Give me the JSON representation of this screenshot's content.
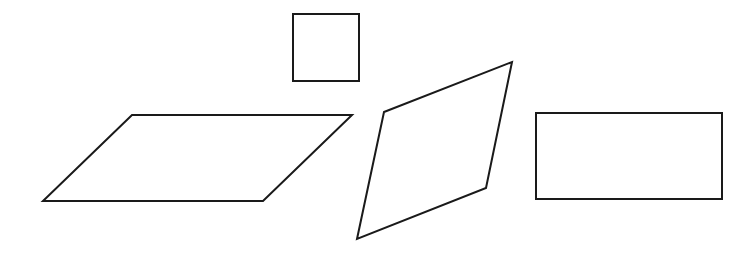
{
  "diagram": {
    "background": "#ffffff",
    "stroke_color": "#1a1a1a",
    "shapes": [
      {
        "name": "square",
        "type": "polygon",
        "stroke_width": 2,
        "points": [
          [
            293,
            14
          ],
          [
            359,
            14
          ],
          [
            359,
            81
          ],
          [
            293,
            81
          ]
        ]
      },
      {
        "name": "parallelogram",
        "type": "polygon",
        "stroke_width": 2,
        "points": [
          [
            132,
            115
          ],
          [
            352,
            115
          ],
          [
            263,
            201
          ],
          [
            43,
            201
          ]
        ]
      },
      {
        "name": "rhombus",
        "type": "polygon",
        "stroke_width": 2,
        "points": [
          [
            384,
            112
          ],
          [
            512,
            62
          ],
          [
            486,
            188
          ],
          [
            357,
            239
          ]
        ]
      },
      {
        "name": "rectangle",
        "type": "polygon",
        "stroke_width": 2,
        "points": [
          [
            536,
            113
          ],
          [
            722,
            113
          ],
          [
            722,
            199
          ],
          [
            536,
            199
          ]
        ]
      }
    ]
  }
}
